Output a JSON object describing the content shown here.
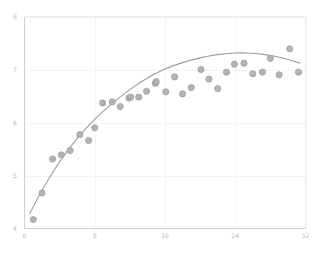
{
  "chart_data": {
    "type": "scatter",
    "title": "",
    "subtitle": "",
    "xlabel": "",
    "ylabel": "",
    "xlim": [
      0,
      32
    ],
    "ylim": [
      4,
      8
    ],
    "x_ticks": [
      0,
      8,
      16,
      24,
      32
    ],
    "x_tick_labels": [
      "0",
      "8",
      "16",
      "24",
      "32"
    ],
    "y_ticks": [
      4,
      5,
      6,
      7,
      8
    ],
    "y_tick_labels": [
      "4",
      "5",
      "6",
      "7",
      "8"
    ],
    "grid": true,
    "legend": false,
    "legend_position": "none",
    "marker_color": "#b0b0b0",
    "marker_edge_color": "#9a9a9a",
    "line_color": "#9c9c9c",
    "grid_color": "#f4f4f6",
    "axis_color": "#cfcfcf",
    "tick_label_color": "#b9b9b9",
    "background_color": "#ffffff",
    "series": [
      {
        "name": "observations",
        "type": "scatter",
        "points": [
          [
            1.0,
            4.17
          ],
          [
            2.0,
            4.67
          ],
          [
            3.2,
            5.31
          ],
          [
            4.2,
            5.39
          ],
          [
            5.2,
            5.47
          ],
          [
            6.3,
            5.77
          ],
          [
            7.3,
            5.66
          ],
          [
            8.0,
            5.9
          ],
          [
            8.9,
            6.37
          ],
          [
            10.0,
            6.39
          ],
          [
            10.9,
            6.3
          ],
          [
            11.9,
            6.46
          ],
          [
            12.1,
            6.48
          ],
          [
            13.0,
            6.48
          ],
          [
            13.9,
            6.59
          ],
          [
            14.9,
            6.74
          ],
          [
            15.0,
            6.77
          ],
          [
            16.1,
            6.58
          ],
          [
            17.1,
            6.86
          ],
          [
            18.0,
            6.54
          ],
          [
            19.0,
            6.66
          ],
          [
            20.1,
            7.0
          ],
          [
            21.0,
            6.82
          ],
          [
            22.0,
            6.64
          ],
          [
            23.0,
            6.95
          ],
          [
            23.9,
            7.1
          ],
          [
            25.0,
            7.12
          ],
          [
            26.0,
            6.92
          ],
          [
            27.1,
            6.95
          ],
          [
            28.0,
            7.21
          ],
          [
            29.0,
            6.9
          ],
          [
            30.2,
            7.39
          ],
          [
            31.2,
            6.95
          ]
        ]
      },
      {
        "name": "fitted-curve",
        "type": "line",
        "points": [
          [
            0.6,
            4.28
          ],
          [
            2.0,
            4.72
          ],
          [
            4.0,
            5.26
          ],
          [
            6.0,
            5.7
          ],
          [
            8.0,
            6.06
          ],
          [
            10.0,
            6.36
          ],
          [
            12.0,
            6.62
          ],
          [
            14.0,
            6.84
          ],
          [
            16.0,
            7.01
          ],
          [
            18.0,
            7.13
          ],
          [
            20.0,
            7.22
          ],
          [
            22.0,
            7.28
          ],
          [
            24.0,
            7.31
          ],
          [
            25.5,
            7.31
          ],
          [
            27.0,
            7.29
          ],
          [
            28.5,
            7.25
          ],
          [
            30.0,
            7.19
          ],
          [
            31.4,
            7.12
          ]
        ]
      }
    ]
  },
  "caption": {
    "text": ""
  }
}
